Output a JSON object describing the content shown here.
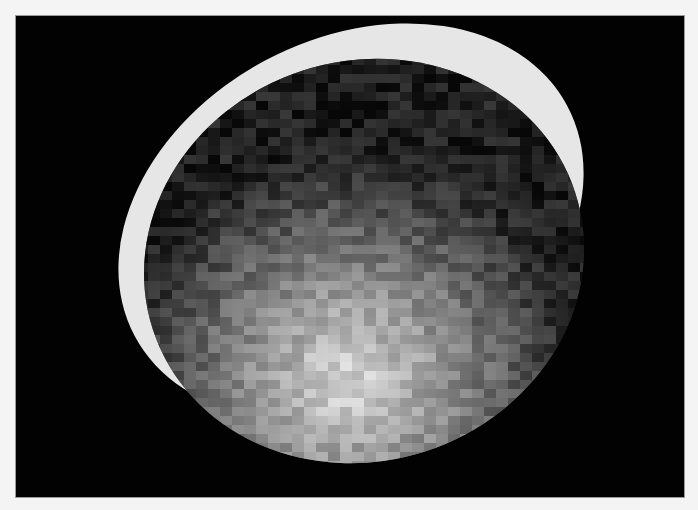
{
  "image": {
    "subject": "pixelated grayscale planetary disk with bright crescent limb",
    "colors": {
      "page_background": "#f4f4f4",
      "frame_background": "#020202",
      "crescent": "#e6e6e6"
    }
  }
}
